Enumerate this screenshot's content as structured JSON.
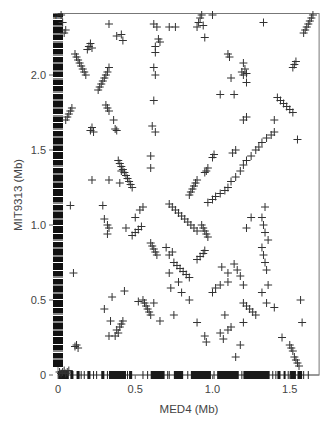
{
  "chart_data": {
    "type": "scatter",
    "title": "",
    "xlabel": "MED4 (Mb)",
    "ylabel": "MIT9313 (Mb)",
    "xlim": [
      0,
      1.69
    ],
    "ylim": [
      0,
      2.41
    ],
    "xticks": [
      0,
      0.5,
      1.0,
      1.5
    ],
    "xtick_labels": [
      "0",
      "0.5",
      "1.0",
      "1.5"
    ],
    "yticks": [
      0,
      0.5,
      1.0,
      1.5,
      2.0
    ],
    "ytick_labels": [
      "0",
      "0.5",
      "1.0",
      "1.5",
      "2.0"
    ],
    "grid": false,
    "legend": null,
    "marker": "+",
    "marker_color": "#333333",
    "frame": "box",
    "series": [
      {
        "name": "ortholog pairs",
        "points": [
          [
            0.02,
            2.4
          ],
          [
            0.03,
            2.35
          ],
          [
            0.05,
            2.3
          ],
          [
            0.04,
            2.28
          ],
          [
            0.11,
            2.14
          ],
          [
            0.12,
            2.12
          ],
          [
            0.13,
            2.1
          ],
          [
            0.14,
            2.08
          ],
          [
            0.15,
            2.06
          ],
          [
            0.16,
            2.04
          ],
          [
            0.17,
            2.02
          ],
          [
            0.18,
            2.0
          ],
          [
            0.19,
            2.17
          ],
          [
            0.2,
            2.19
          ],
          [
            0.21,
            2.21
          ],
          [
            0.22,
            2.18
          ],
          [
            0.27,
            1.92
          ],
          [
            0.28,
            1.94
          ],
          [
            0.29,
            1.96
          ],
          [
            0.3,
            1.98
          ],
          [
            0.31,
            2.0
          ],
          [
            0.32,
            2.02
          ],
          [
            0.26,
            1.9
          ],
          [
            0.33,
            2.05
          ],
          [
            0.06,
            1.72
          ],
          [
            0.07,
            1.74
          ],
          [
            0.08,
            1.76
          ],
          [
            0.09,
            1.78
          ],
          [
            0.05,
            1.7
          ],
          [
            0.21,
            1.63
          ],
          [
            0.22,
            1.65
          ],
          [
            0.23,
            1.62
          ],
          [
            0.31,
            1.8
          ],
          [
            0.32,
            1.78
          ],
          [
            0.33,
            1.76
          ],
          [
            0.36,
            1.7
          ],
          [
            0.37,
            1.64
          ],
          [
            0.38,
            1.63
          ],
          [
            0.62,
            2.34
          ],
          [
            0.62,
            2.05
          ],
          [
            0.63,
            2.0
          ],
          [
            0.63,
            2.19
          ],
          [
            0.63,
            2.15
          ],
          [
            0.62,
            1.83
          ],
          [
            0.63,
            1.62
          ],
          [
            0.61,
            1.66
          ],
          [
            0.65,
            2.24
          ],
          [
            0.66,
            2.22
          ],
          [
            0.41,
            2.27
          ],
          [
            0.42,
            2.23
          ],
          [
            0.64,
            2.32
          ],
          [
            0.72,
            2.32
          ],
          [
            0.76,
            2.32
          ],
          [
            0.92,
            2.38
          ],
          [
            0.93,
            2.4
          ],
          [
            0.91,
            2.35
          ],
          [
            0.94,
            2.33
          ],
          [
            0.9,
            2.32
          ],
          [
            0.95,
            2.25
          ],
          [
            1.0,
            2.4
          ],
          [
            0.33,
            2.34
          ],
          [
            0.38,
            2.26
          ],
          [
            0.39,
            1.43
          ],
          [
            0.4,
            1.41
          ],
          [
            0.41,
            1.39
          ],
          [
            0.42,
            1.37
          ],
          [
            0.43,
            1.35
          ],
          [
            0.44,
            1.33
          ],
          [
            0.45,
            1.31
          ],
          [
            0.46,
            1.29
          ],
          [
            0.47,
            1.27
          ],
          [
            0.48,
            1.25
          ],
          [
            0.6,
            1.46
          ],
          [
            0.6,
            1.38
          ],
          [
            0.41,
            1.36
          ],
          [
            0.22,
            1.3
          ],
          [
            0.33,
            1.3
          ],
          [
            0.4,
            1.28
          ],
          [
            0.08,
            1.13
          ],
          [
            0.29,
            1.13
          ],
          [
            0.3,
            1.04
          ],
          [
            0.32,
            1.0
          ],
          [
            0.33,
            0.98
          ],
          [
            0.32,
            0.94
          ],
          [
            0.44,
            0.98
          ],
          [
            0.5,
            1.05
          ],
          [
            0.53,
            1.1
          ],
          [
            0.55,
            1.12
          ],
          [
            0.48,
            0.93
          ],
          [
            0.5,
            0.95
          ],
          [
            0.52,
            0.97
          ],
          [
            0.54,
            0.99
          ],
          [
            0.6,
            0.88
          ],
          [
            0.61,
            0.86
          ],
          [
            0.62,
            0.84
          ],
          [
            0.63,
            0.82
          ],
          [
            0.64,
            0.8
          ],
          [
            0.7,
            0.85
          ],
          [
            0.72,
            0.8
          ],
          [
            0.74,
            0.82
          ],
          [
            0.85,
            1.2
          ],
          [
            0.86,
            1.22
          ],
          [
            0.87,
            1.24
          ],
          [
            0.88,
            1.26
          ],
          [
            0.89,
            1.28
          ],
          [
            0.9,
            1.3
          ],
          [
            0.95,
            1.35
          ],
          [
            0.96,
            1.36
          ],
          [
            0.97,
            1.38
          ],
          [
            1.0,
            1.45
          ],
          [
            1.01,
            1.47
          ],
          [
            0.93,
            1.0
          ],
          [
            0.94,
            0.98
          ],
          [
            0.95,
            0.96
          ],
          [
            0.96,
            0.94
          ],
          [
            0.97,
            0.92
          ],
          [
            0.97,
            1.15
          ],
          [
            1.0,
            1.17
          ],
          [
            1.02,
            1.19
          ],
          [
            1.05,
            1.21
          ],
          [
            1.08,
            1.23
          ],
          [
            1.1,
            1.25
          ],
          [
            1.12,
            1.29
          ],
          [
            1.15,
            1.32
          ],
          [
            1.18,
            1.36
          ],
          [
            1.2,
            1.4
          ],
          [
            1.22,
            1.43
          ],
          [
            1.25,
            1.46
          ],
          [
            1.28,
            1.5
          ],
          [
            1.3,
            1.52
          ],
          [
            1.32,
            1.55
          ],
          [
            1.35,
            1.58
          ],
          [
            1.38,
            1.6
          ],
          [
            1.4,
            1.62
          ],
          [
            1.13,
            1.48
          ],
          [
            1.15,
            1.5
          ],
          [
            1.2,
            1.7
          ],
          [
            1.22,
            1.72
          ],
          [
            1.4,
            1.7
          ],
          [
            1.55,
            1.57
          ],
          [
            1.42,
            1.85
          ],
          [
            1.44,
            1.83
          ],
          [
            1.46,
            1.81
          ],
          [
            1.48,
            1.79
          ],
          [
            1.5,
            1.77
          ],
          [
            1.52,
            1.75
          ],
          [
            1.52,
            2.05
          ],
          [
            1.53,
            2.07
          ],
          [
            1.54,
            2.09
          ],
          [
            1.6,
            2.3
          ],
          [
            1.61,
            2.32
          ],
          [
            1.62,
            2.34
          ],
          [
            1.63,
            2.36
          ],
          [
            1.64,
            2.38
          ],
          [
            1.65,
            2.4
          ],
          [
            1.59,
            2.28
          ],
          [
            1.33,
            2.35
          ],
          [
            1.2,
            2.08
          ],
          [
            1.21,
            2.04
          ],
          [
            1.2,
            2.0
          ],
          [
            1.19,
            2.02
          ],
          [
            1.22,
            2.01
          ],
          [
            1.1,
            2.14
          ],
          [
            1.11,
            2.12
          ],
          [
            1.14,
            1.87
          ],
          [
            1.22,
            1.95
          ],
          [
            1.05,
            1.87
          ],
          [
            1.12,
            1.98
          ],
          [
            0.72,
            1.14
          ],
          [
            0.74,
            1.12
          ],
          [
            0.76,
            1.1
          ],
          [
            0.78,
            1.08
          ],
          [
            0.8,
            1.06
          ],
          [
            0.82,
            1.04
          ],
          [
            0.84,
            1.02
          ],
          [
            0.86,
            1.0
          ],
          [
            0.88,
            0.98
          ],
          [
            0.9,
            0.96
          ],
          [
            0.75,
            0.75
          ],
          [
            0.77,
            0.73
          ],
          [
            0.79,
            0.71
          ],
          [
            0.81,
            0.69
          ],
          [
            0.83,
            0.67
          ],
          [
            0.85,
            0.65
          ],
          [
            0.9,
            0.77
          ],
          [
            0.92,
            0.79
          ],
          [
            0.94,
            0.81
          ],
          [
            0.95,
            0.83
          ],
          [
            0.72,
            0.68
          ],
          [
            0.73,
            0.58
          ],
          [
            0.78,
            0.62
          ],
          [
            0.8,
            0.55
          ],
          [
            0.85,
            0.5
          ],
          [
            0.55,
            0.5
          ],
          [
            0.56,
            0.48
          ],
          [
            0.57,
            0.46
          ],
          [
            0.58,
            0.44
          ],
          [
            0.59,
            0.42
          ],
          [
            0.6,
            0.4
          ],
          [
            0.38,
            0.3
          ],
          [
            0.39,
            0.28
          ],
          [
            0.4,
            0.32
          ],
          [
            0.41,
            0.34
          ],
          [
            0.42,
            0.36
          ],
          [
            0.37,
            0.26
          ],
          [
            0.1,
            0.68
          ],
          [
            0.3,
            0.44
          ],
          [
            0.35,
            0.52
          ],
          [
            0.34,
            0.36
          ],
          [
            0.33,
            0.26
          ],
          [
            0.43,
            0.56
          ],
          [
            0.52,
            0.49
          ],
          [
            0.12,
            0.2
          ],
          [
            0.13,
            0.18
          ],
          [
            0.11,
            0.19
          ],
          [
            0.62,
            0.48
          ],
          [
            0.66,
            0.36
          ],
          [
            0.75,
            0.4
          ],
          [
            0.9,
            0.35
          ],
          [
            0.95,
            0.26
          ],
          [
            0.96,
            0.22
          ],
          [
            1.0,
            0.55
          ],
          [
            1.02,
            0.58
          ],
          [
            1.05,
            0.6
          ],
          [
            1.1,
            0.62
          ],
          [
            1.05,
            0.28
          ],
          [
            1.07,
            0.24
          ],
          [
            1.1,
            0.3
          ],
          [
            1.15,
            0.12
          ],
          [
            1.18,
            0.2
          ],
          [
            1.12,
            0.32
          ],
          [
            1.2,
            0.35
          ],
          [
            1.08,
            0.4
          ],
          [
            1.06,
            0.72
          ],
          [
            1.1,
            0.68
          ],
          [
            1.14,
            0.74
          ],
          [
            1.16,
            0.7
          ],
          [
            1.18,
            0.66
          ],
          [
            1.2,
            0.6
          ],
          [
            1.2,
            0.48
          ],
          [
            1.22,
            0.46
          ],
          [
            1.24,
            0.44
          ],
          [
            1.26,
            0.42
          ],
          [
            1.28,
            0.4
          ],
          [
            1.32,
            0.85
          ],
          [
            1.33,
            0.8
          ],
          [
            1.34,
            0.75
          ],
          [
            1.35,
            0.7
          ],
          [
            1.36,
            0.6
          ],
          [
            1.32,
            0.55
          ],
          [
            1.35,
            0.48
          ],
          [
            1.4,
            0.45
          ],
          [
            1.36,
            0.9
          ],
          [
            1.32,
            1.05
          ],
          [
            1.33,
            1.0
          ],
          [
            1.34,
            0.95
          ],
          [
            1.34,
            1.12
          ],
          [
            1.25,
            1.05
          ],
          [
            1.22,
            0.98
          ],
          [
            1.5,
            0.2
          ],
          [
            1.51,
            0.18
          ],
          [
            1.52,
            0.16
          ],
          [
            1.53,
            0.12
          ],
          [
            1.54,
            0.1
          ],
          [
            1.55,
            0.08
          ],
          [
            1.56,
            0.06
          ],
          [
            1.57,
            0.5
          ],
          [
            1.45,
            0.25
          ],
          [
            1.58,
            0.35
          ],
          [
            0.01,
            0.02
          ],
          [
            0.02,
            0.01
          ],
          [
            0.03,
            0.02
          ],
          [
            0.04,
            0.03
          ],
          [
            0.05,
            0.01
          ],
          [
            0.06,
            0.02
          ],
          [
            0.07,
            0.03
          ]
        ]
      }
    ],
    "axis_rug": {
      "y_axis_strip_color": "#111111",
      "x_axis_rug_ranges_mb": [
        [
          0.0,
          0.07
        ],
        [
          0.08,
          0.1
        ],
        [
          0.12,
          0.14
        ],
        [
          0.19,
          0.21
        ],
        [
          0.28,
          0.3
        ],
        [
          0.33,
          0.44
        ],
        [
          0.46,
          0.48
        ],
        [
          0.6,
          0.69
        ],
        [
          0.75,
          0.81
        ],
        [
          0.86,
          0.99
        ],
        [
          1.03,
          1.17
        ],
        [
          1.2,
          1.37
        ],
        [
          1.42,
          1.44
        ],
        [
          1.46,
          1.47
        ],
        [
          1.5,
          1.54
        ],
        [
          1.55,
          1.58
        ]
      ],
      "x_axis_rug_singles_mb": [
        0.15,
        0.17,
        0.23,
        0.25,
        0.32,
        0.45,
        0.55,
        0.58,
        0.71,
        0.72,
        0.84,
        1.01,
        1.19,
        1.39,
        1.41,
        1.49,
        1.59,
        1.62
      ]
    }
  }
}
